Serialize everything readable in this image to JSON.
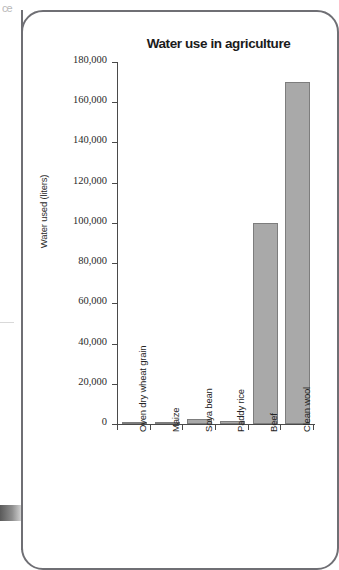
{
  "scan": {
    "fragment_text": "ce",
    "edge_name": "page-edge-artifact"
  },
  "chart_data": {
    "type": "bar",
    "title": "Water use in agriculture",
    "xlabel": "",
    "ylabel": "Water used (liters)",
    "ylim": [
      0,
      180000
    ],
    "ytick_step": 20000,
    "grid": false,
    "legend": "none",
    "bar_color": "#a9a9a9",
    "bar_border_color": "#7d7d7d",
    "axis_color": "#4a4a4a",
    "categories": [
      "Oven dry wheat grain",
      "Maize",
      "Soya bean",
      "Paddy rice",
      "Beef",
      "Clean wool"
    ],
    "values": [
      1000,
      900,
      2500,
      1500,
      100000,
      170000
    ],
    "ytick_labels": [
      "0",
      "20,000",
      "40,000",
      "60,000",
      "80,000",
      "100,000",
      "120,000",
      "140,000",
      "160,000",
      "180,000"
    ],
    "ytick_values": [
      0,
      20000,
      40000,
      60000,
      80000,
      100000,
      120000,
      140000,
      160000,
      180000
    ]
  }
}
